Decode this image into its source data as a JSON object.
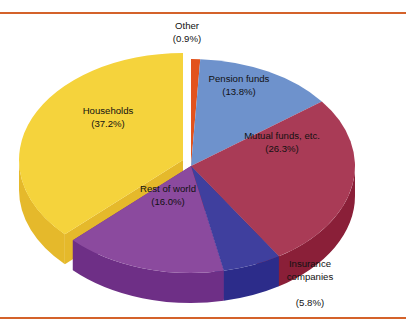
{
  "figure": {
    "background_color": "#FFFFFF",
    "rule_color": "#D4622A",
    "label_text_color": "#111111"
  },
  "chart_data": {
    "type": "pie",
    "title": "",
    "subtitle": "",
    "xlabel": "",
    "ylabel": "",
    "legend_position": "none",
    "grid": false,
    "style": "3d-exploded",
    "value_unit": "percent",
    "total": 100.0,
    "categories": [
      "Other",
      "Pension funds",
      "Mutual funds, etc.",
      "Insurance companies",
      "Rest of world",
      "Households"
    ],
    "values": [
      0.9,
      13.8,
      26.3,
      5.8,
      16.0,
      37.2
    ],
    "slices": [
      {
        "label": "Other",
        "value": 0.9,
        "value_label": "(0.9%)",
        "color": "#E2521C",
        "side_color": "#B33C12",
        "exploded": false,
        "label_placement": "outside-top",
        "label_x": 187,
        "label_y": 26,
        "pct_x": 187,
        "pct_y": 39
      },
      {
        "label": "Pension funds",
        "value": 13.8,
        "value_label": "(13.8%)",
        "color": "#6E92CC",
        "side_color": "#4F72AE",
        "exploded": false,
        "label_placement": "inside",
        "label_x": 239,
        "label_y": 79,
        "pct_x": 239,
        "pct_y": 92
      },
      {
        "label": "Mutual funds, etc.",
        "value": 26.3,
        "value_label": "(26.3%)",
        "color": "#A93B56",
        "side_color": "#8A1F38",
        "exploded": false,
        "label_placement": "inside",
        "label_x": 282,
        "label_y": 136,
        "pct_x": 282,
        "pct_y": 149
      },
      {
        "label": "Insurance companies",
        "value": 5.8,
        "value_label": "(5.8%)",
        "color": "#3F3F9E",
        "side_color": "#2C2C8A",
        "exploded": false,
        "label_placement": "outside-bottom-right",
        "label_line1": "Insurance",
        "label_line2": "companies",
        "label_x": 310,
        "label_y": 277,
        "pct_x": 310,
        "pct_y": 303
      },
      {
        "label": "Rest of world",
        "value": 16.0,
        "value_label": "(16.0%)",
        "color": "#8B4A9E",
        "side_color": "#6E2F86",
        "exploded": false,
        "label_placement": "inside",
        "label_x": 168,
        "label_y": 189,
        "pct_x": 168,
        "pct_y": 202
      },
      {
        "label": "Households",
        "value": 37.2,
        "value_label": "(37.2%)",
        "color": "#F5D33C",
        "side_color": "#E5B92B",
        "exploded": true,
        "label_placement": "inside",
        "label_x": 108,
        "label_y": 111,
        "pct_x": 108,
        "pct_y": 124
      }
    ],
    "geometry": {
      "center_x": 191,
      "center_y": 166,
      "radius_x": 164,
      "radius_y": 107,
      "depth": 30,
      "start_angle_deg": -90,
      "direction": "clockwise",
      "explode_offset_x": -8,
      "explode_offset_y": -6
    }
  }
}
